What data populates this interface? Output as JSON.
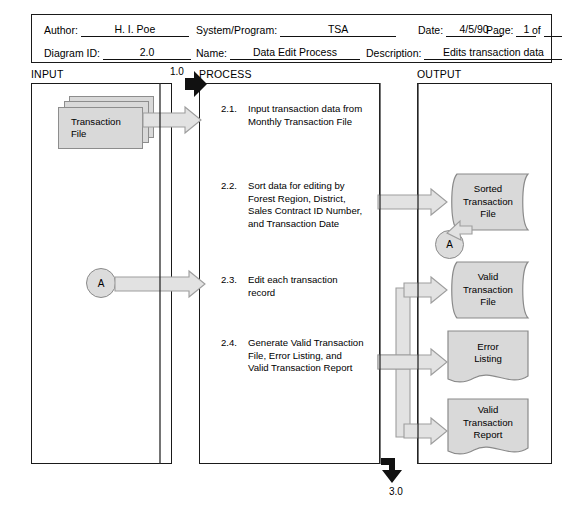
{
  "form": {
    "fields": [
      {
        "label": "Author:",
        "value": "H. I. Poe"
      },
      {
        "label": "System/Program:",
        "value": "TSA"
      },
      {
        "label": "Date:",
        "value": "4/5/90"
      },
      {
        "label": "Page:",
        "value": "1"
      },
      {
        "label": "of",
        "value": ""
      },
      {
        "label": "Diagram ID:",
        "value": "2.0"
      },
      {
        "label": "Name:",
        "value": "Data Edit Process"
      },
      {
        "label": "Description:",
        "value": "Edits transaction data"
      }
    ]
  },
  "columns": {
    "input": "INPUT",
    "process": "PROCESS",
    "output": "OUTPUT"
  },
  "entry_tag": "1.0",
  "exit_tag": "3.0",
  "input_items": [
    {
      "name": "transaction-file",
      "label": "Transaction\nFile"
    },
    {
      "name": "connector-a-input",
      "label": "A"
    }
  ],
  "steps": [
    {
      "num": "2.1.",
      "text": "Input transaction data from\nMonthly Transaction File"
    },
    {
      "num": "2.2.",
      "text": "Sort data for editing by\nForest Region, District,\nSales Contract ID Number,\nand Transaction Date"
    },
    {
      "num": "2.3.",
      "text": "Edit each transaction\nrecord"
    },
    {
      "num": "2.4.",
      "text": "Generate Valid Transaction\nFile, Error Listing, and\nValid Transaction Report"
    }
  ],
  "outputs": [
    {
      "name": "sorted-transaction-file",
      "label": "Sorted\nTransaction\nFile",
      "shape": "data-file"
    },
    {
      "name": "connector-a-output",
      "label": "A",
      "shape": "connector"
    },
    {
      "name": "valid-transaction-file",
      "label": "Valid\nTransaction\nFile",
      "shape": "data-file"
    },
    {
      "name": "error-listing",
      "label": "Error\nListing",
      "shape": "document"
    },
    {
      "name": "valid-transaction-report",
      "label": "Valid\nTransaction\nReport",
      "shape": "document"
    }
  ],
  "colors": {
    "shape_fill": "#d9d9d9",
    "shape_stroke": "#8a8a8a",
    "arrow_fill": "#e0e0e0",
    "arrow_stroke": "#9a9a9a",
    "line": "#1a1a1a"
  }
}
